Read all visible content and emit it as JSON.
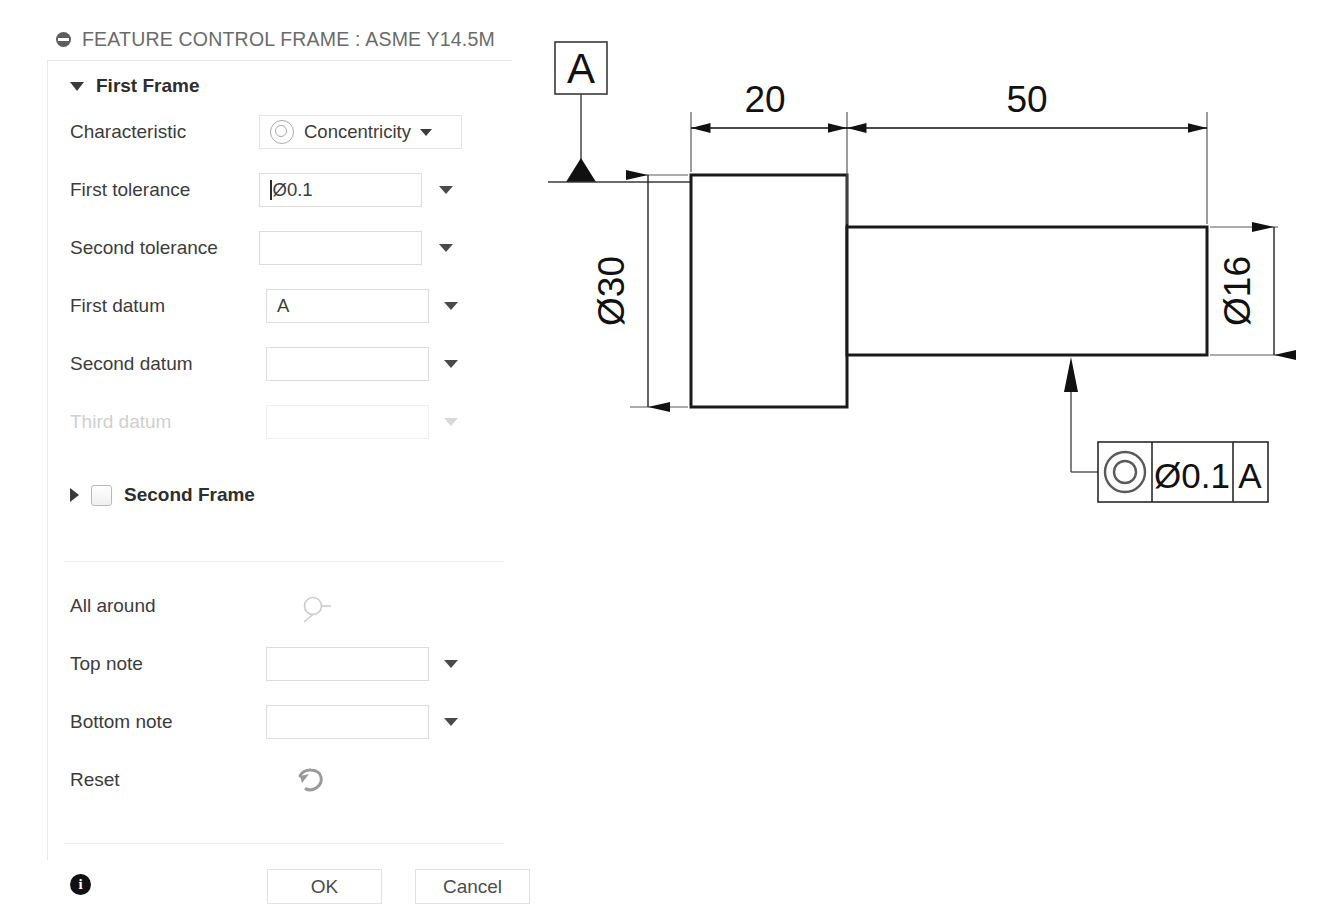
{
  "dialog": {
    "title": "FEATURE CONTROL FRAME : ASME Y14.5M",
    "title_icon": "minus-circle-icon",
    "first_frame": {
      "label": "First Frame",
      "expanded": true,
      "fields": [
        {
          "label": "Characteristic",
          "value": "Concentricity",
          "icon": "concentricity-icon",
          "disabled": false
        },
        {
          "label": "First tolerance",
          "value": "Ø0.1",
          "disabled": false
        },
        {
          "label": "Second tolerance",
          "value": "",
          "disabled": false
        },
        {
          "label": "First datum",
          "value": "A",
          "disabled": false
        },
        {
          "label": "Second datum",
          "value": "",
          "disabled": false
        },
        {
          "label": "Third datum",
          "value": "",
          "disabled": true
        }
      ]
    },
    "second_frame": {
      "label": "Second Frame",
      "expanded": false,
      "checked": false
    },
    "modifiers": [
      {
        "label": "All around",
        "type": "icon",
        "icon": "all-around-icon",
        "value": ""
      },
      {
        "label": "Top note",
        "type": "combo",
        "value": ""
      },
      {
        "label": "Bottom note",
        "type": "combo",
        "value": ""
      },
      {
        "label": "Reset",
        "type": "icon",
        "icon": "undo-arrow-icon",
        "value": ""
      }
    ],
    "footer": {
      "info_icon": "info-icon",
      "info_glyph": "i",
      "ok_label": "OK",
      "cancel_label": "Cancel"
    }
  },
  "drawing": {
    "datum_label": "A",
    "dimensions": [
      {
        "name": "length-step",
        "value": "20"
      },
      {
        "name": "length-shaft",
        "value": "50"
      },
      {
        "name": "diameter-big",
        "value": "Ø30"
      },
      {
        "name": "diameter-small",
        "value": "Ø16"
      }
    ],
    "feature_control_frame": {
      "symbol": "concentricity-icon",
      "tolerance": "Ø0.1",
      "datum": "A"
    }
  }
}
